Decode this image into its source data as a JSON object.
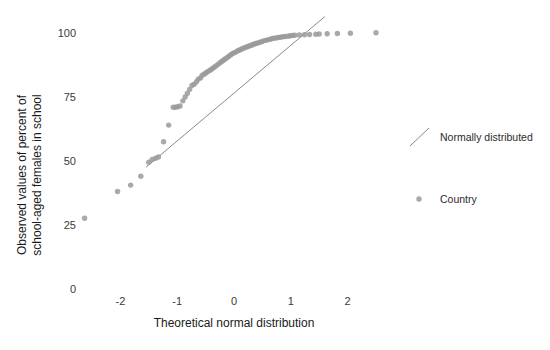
{
  "chart_data": {
    "type": "scatter",
    "title": "",
    "subtitle": "",
    "xlabel": "Theoretical normal distribution",
    "ylabel": "Observed values of percent of school-aged females in school",
    "ylabel_lines": [
      "Observed values of percent of",
      "school-aged females in school"
    ],
    "xlim": [
      -2.95,
      3.2
    ],
    "ylim": [
      -6,
      112
    ],
    "xticks": [
      -2,
      -1,
      0,
      1,
      2
    ],
    "xtick_labels": [
      "-2",
      "-1",
      "0",
      "1",
      "2"
    ],
    "yticks": [
      0,
      25,
      50,
      75,
      100
    ],
    "ytick_labels": [
      "0",
      "25",
      "50",
      "75",
      "100"
    ],
    "grid": false,
    "legend_position": "right",
    "point_color": "#9a9a9a",
    "line_color": "#8a8a8a",
    "background": "#ffffff",
    "series": [
      {
        "name": "Country",
        "type": "scatter",
        "marker": "circle",
        "color": "#9a9a9a",
        "points": [
          [
            -2.63,
            27.5
          ],
          [
            -2.05,
            38.0
          ],
          [
            -1.82,
            40.5
          ],
          [
            -1.64,
            44.0
          ],
          [
            -1.5,
            49.5
          ],
          [
            -1.44,
            50.5
          ],
          [
            -1.38,
            51.0
          ],
          [
            -1.33,
            51.5
          ],
          [
            -1.24,
            57.5
          ],
          [
            -1.15,
            64.0
          ],
          [
            -1.07,
            71.0
          ],
          [
            -1.03,
            71.0
          ],
          [
            -0.99,
            71.2
          ],
          [
            -0.95,
            71.5
          ],
          [
            -0.9,
            73.5
          ],
          [
            -0.86,
            75.0
          ],
          [
            -0.82,
            76.5
          ],
          [
            -0.78,
            78.0
          ],
          [
            -0.74,
            79.5
          ],
          [
            -0.7,
            80.0
          ],
          [
            -0.66,
            81.0
          ],
          [
            -0.63,
            82.0
          ],
          [
            -0.59,
            82.5
          ],
          [
            -0.56,
            83.5
          ],
          [
            -0.52,
            84.0
          ],
          [
            -0.49,
            84.5
          ],
          [
            -0.46,
            85.0
          ],
          [
            -0.42,
            85.5
          ],
          [
            -0.39,
            86.0
          ],
          [
            -0.36,
            86.5
          ],
          [
            -0.33,
            87.0
          ],
          [
            -0.3,
            87.5
          ],
          [
            -0.27,
            88.0
          ],
          [
            -0.24,
            88.5
          ],
          [
            -0.21,
            89.0
          ],
          [
            -0.18,
            89.5
          ],
          [
            -0.15,
            90.0
          ],
          [
            -0.12,
            90.5
          ],
          [
            -0.09,
            91.0
          ],
          [
            -0.06,
            91.5
          ],
          [
            -0.03,
            92.0
          ],
          [
            0.0,
            92.3
          ],
          [
            0.03,
            92.6
          ],
          [
            0.06,
            93.0
          ],
          [
            0.09,
            93.3
          ],
          [
            0.12,
            93.6
          ],
          [
            0.15,
            94.0
          ],
          [
            0.18,
            94.2
          ],
          [
            0.21,
            94.5
          ],
          [
            0.24,
            94.8
          ],
          [
            0.27,
            95.0
          ],
          [
            0.3,
            95.3
          ],
          [
            0.33,
            95.5
          ],
          [
            0.36,
            95.8
          ],
          [
            0.39,
            96.0
          ],
          [
            0.42,
            96.2
          ],
          [
            0.46,
            96.5
          ],
          [
            0.49,
            96.7
          ],
          [
            0.52,
            97.0
          ],
          [
            0.56,
            97.2
          ],
          [
            0.59,
            97.4
          ],
          [
            0.63,
            97.6
          ],
          [
            0.66,
            97.8
          ],
          [
            0.7,
            98.0
          ],
          [
            0.74,
            98.1
          ],
          [
            0.78,
            98.3
          ],
          [
            0.82,
            98.4
          ],
          [
            0.86,
            98.6
          ],
          [
            0.9,
            98.7
          ],
          [
            0.95,
            98.8
          ],
          [
            0.99,
            99.0
          ],
          [
            1.03,
            99.1
          ],
          [
            1.07,
            99.2
          ],
          [
            1.15,
            99.3
          ],
          [
            1.24,
            99.4
          ],
          [
            1.33,
            99.5
          ],
          [
            1.44,
            99.6
          ],
          [
            1.5,
            99.7
          ],
          [
            1.64,
            99.8
          ],
          [
            1.82,
            99.9
          ],
          [
            2.05,
            100.0
          ],
          [
            2.5,
            100.2
          ]
        ]
      },
      {
        "name": "Normally distributed",
        "type": "line",
        "color": "#8a8a8a",
        "x_from": -1.55,
        "y_from": 47.5,
        "x_to": 1.6,
        "y_to": 106.5
      }
    ],
    "legend": [
      {
        "label": "Normally distributed",
        "marker": "line",
        "color": "#8a8a8a"
      },
      {
        "label": "Country",
        "marker": "circle",
        "color": "#9a9a9a"
      }
    ]
  }
}
